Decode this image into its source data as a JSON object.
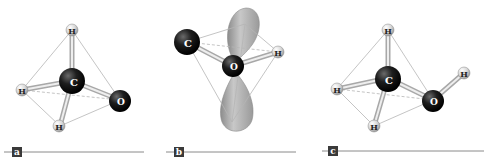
{
  "colors": {
    "heavy_atom": "#1a1a1a",
    "hydrogen": "#d9d9d9",
    "bond": "#bdbdbd",
    "edge": "#b0b0b0",
    "lobe": "#a8a8a8",
    "label_box": "#3a3a3a",
    "rule": "#8a8a8a"
  },
  "panels": [
    {
      "label": "a",
      "atoms": [
        {
          "symbol": "H",
          "name": "hydrogen-top"
        },
        {
          "symbol": "C",
          "name": "carbon"
        },
        {
          "symbol": "H",
          "name": "hydrogen-left"
        },
        {
          "symbol": "O",
          "name": "oxygen"
        },
        {
          "symbol": "H",
          "name": "hydrogen-bottom"
        }
      ]
    },
    {
      "label": "b",
      "atoms": [
        {
          "symbol": "C",
          "name": "carbon"
        },
        {
          "symbol": "O",
          "name": "oxygen"
        },
        {
          "symbol": "H",
          "name": "hydrogen"
        }
      ],
      "orbitals": [
        "lone-pair-lobe-upper",
        "lone-pair-lobe-lower"
      ]
    },
    {
      "label": "c",
      "atoms": [
        {
          "symbol": "H",
          "name": "hydrogen-top"
        },
        {
          "symbol": "C",
          "name": "carbon"
        },
        {
          "symbol": "H",
          "name": "hydrogen-left"
        },
        {
          "symbol": "O",
          "name": "oxygen"
        },
        {
          "symbol": "H",
          "name": "hydrogen-hydroxyl"
        },
        {
          "symbol": "H",
          "name": "hydrogen-bottom"
        }
      ]
    }
  ]
}
